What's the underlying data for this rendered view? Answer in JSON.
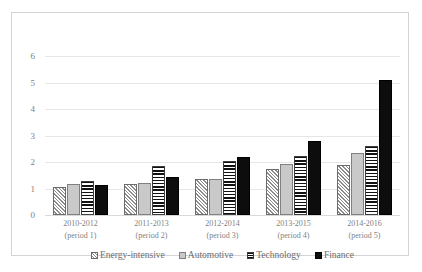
{
  "chart_data": {
    "type": "bar",
    "title": "",
    "subtitle": "",
    "xlabel": "",
    "ylabel": "",
    "ylim": [
      0,
      6
    ],
    "yticks": [
      0,
      1,
      2,
      3,
      4,
      5,
      6
    ],
    "grid": true,
    "legend_position": "bottom",
    "categories": [
      "2010-2012\n(period 1)",
      "2011-2013\n(period 2)",
      "2012-2014\n(period 3)",
      "2013-2015\n(period 4)",
      "2014-2016\n(period 5)"
    ],
    "category_lines": [
      {
        "line1": "2010-2012",
        "line2": "(period 1)"
      },
      {
        "line1": "2011-2013",
        "line2": "(period 2)"
      },
      {
        "line1": "2012-2014",
        "line2": "(period 3)"
      },
      {
        "line1": "2013-2015",
        "line2": "(period 4)"
      },
      {
        "line1": "2014-2016",
        "line2": "(period 5)"
      }
    ],
    "series": [
      {
        "name": "Energy-intensive",
        "pattern": "diagonal-stripes",
        "color": "#8c8c8c",
        "values": [
          1.05,
          1.18,
          1.35,
          1.74,
          1.89
        ]
      },
      {
        "name": "Automotive",
        "pattern": "solid-gray",
        "color": "#c9c9c9",
        "values": [
          1.17,
          1.19,
          1.36,
          1.94,
          2.35
        ]
      },
      {
        "name": "Technology",
        "pattern": "horizontal-stripes",
        "color": "#111111",
        "values": [
          1.28,
          1.85,
          2.05,
          2.24,
          2.6
        ]
      },
      {
        "name": "Finance",
        "pattern": "solid-black",
        "color": "#0d0d0d",
        "values": [
          1.13,
          1.42,
          2.19,
          2.8,
          5.08
        ]
      }
    ]
  },
  "legend": {
    "items": [
      {
        "label": "Energy-intensive",
        "swatch": "legend-swatch-energy-intensive"
      },
      {
        "label": "Automotive",
        "swatch": "legend-swatch-automotive"
      },
      {
        "label": "Technology",
        "swatch": "legend-swatch-technology"
      },
      {
        "label": "Finance",
        "swatch": "legend-swatch-finance"
      }
    ]
  },
  "frame": {
    "border_color": "#d4d4d4",
    "background": "#ffffff",
    "gridline_color": "#e6e6e6"
  }
}
